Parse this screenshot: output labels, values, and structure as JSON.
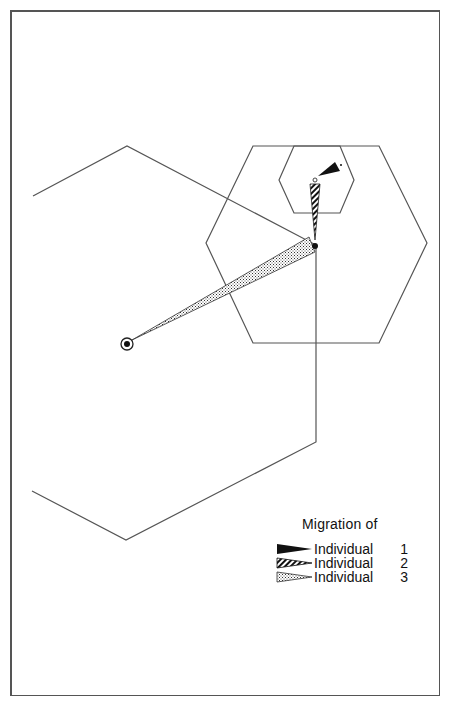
{
  "figure": {
    "legend": {
      "title": "Migration of",
      "items": [
        {
          "label": "Individual",
          "number": "1",
          "pattern": "solid-black"
        },
        {
          "label": "Individual",
          "number": "2",
          "pattern": "diagonal-hatch"
        },
        {
          "label": "Individual",
          "number": "3",
          "pattern": "stipple"
        }
      ]
    },
    "markers": [
      {
        "name": "origin-point",
        "type": "circled-dot"
      },
      {
        "name": "junction-point",
        "type": "solid-dot"
      },
      {
        "name": "small-hex-point",
        "type": "open-circle"
      }
    ],
    "hexagons": [
      "large",
      "medium",
      "small"
    ],
    "colors": {
      "line": "#555555",
      "fill": "#111111"
    }
  }
}
